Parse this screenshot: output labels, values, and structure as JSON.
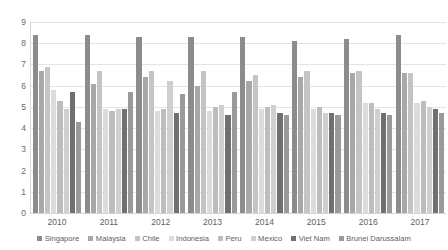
{
  "chart_data": {
    "type": "bar",
    "title": "",
    "subtitle": "",
    "xlabel": "",
    "ylabel": "",
    "ylim": [
      0,
      9
    ],
    "yticks": [
      0,
      1,
      2,
      3,
      4,
      5,
      6,
      7,
      8,
      9
    ],
    "grid": true,
    "legend_position": "bottom",
    "categories": [
      "2010",
      "2011",
      "2012",
      "2013",
      "2014",
      "2015",
      "2016",
      "2017"
    ],
    "series": [
      {
        "name": "Singapore",
        "color": "#8c8c8c",
        "values": [
          8.4,
          8.4,
          8.3,
          8.3,
          8.3,
          8.1,
          8.2,
          8.4
        ]
      },
      {
        "name": "Malaysia",
        "color": "#a8a8a8",
        "values": [
          6.7,
          6.1,
          6.4,
          6.0,
          6.2,
          6.4,
          6.6,
          6.6
        ]
      },
      {
        "name": "Chile",
        "color": "#c4c4c4",
        "values": [
          6.9,
          6.7,
          6.7,
          6.7,
          6.5,
          6.7,
          6.7,
          6.6
        ]
      },
      {
        "name": "Indonesia",
        "color": "#dcdcdc",
        "values": [
          5.8,
          4.9,
          4.8,
          4.8,
          4.9,
          4.9,
          5.2,
          5.2
        ]
      },
      {
        "name": "Peru",
        "color": "#bdbdbd",
        "values": [
          5.3,
          4.8,
          4.9,
          5.0,
          5.0,
          5.0,
          5.2,
          5.3
        ]
      },
      {
        "name": "Mexico",
        "color": "#cfcfcf",
        "values": [
          4.9,
          4.9,
          6.2,
          5.1,
          5.1,
          4.7,
          4.9,
          5.0
        ]
      },
      {
        "name": "Viet Nam",
        "color": "#707070",
        "values": [
          5.7,
          4.9,
          4.7,
          4.6,
          4.7,
          4.7,
          4.7,
          4.9
        ]
      },
      {
        "name": "Brunei Darussalam",
        "color": "#9a9a9a",
        "values": [
          4.3,
          5.7,
          5.6,
          5.7,
          4.6,
          4.6,
          4.6,
          4.7
        ]
      }
    ]
  }
}
